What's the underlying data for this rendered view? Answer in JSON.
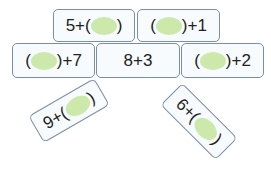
{
  "colors": {
    "blank_fill": "#c9e8a6",
    "card_border": "#7c8ea6",
    "card_bg": "#f7fbfd"
  },
  "cards": [
    {
      "id": "top-left",
      "prefix": "5+(",
      "suffix": ")"
    },
    {
      "id": "top-right",
      "prefix": "(",
      "suffix": ")+1"
    },
    {
      "id": "mid-left",
      "prefix": "(",
      "suffix": ")+7"
    },
    {
      "id": "center",
      "text": "8+3"
    },
    {
      "id": "mid-right",
      "prefix": "(",
      "suffix": ")+2"
    },
    {
      "id": "bottom-left",
      "prefix": "9+(",
      "suffix": ")"
    },
    {
      "id": "bottom-right",
      "prefix": "6+(",
      "suffix": ")"
    }
  ]
}
